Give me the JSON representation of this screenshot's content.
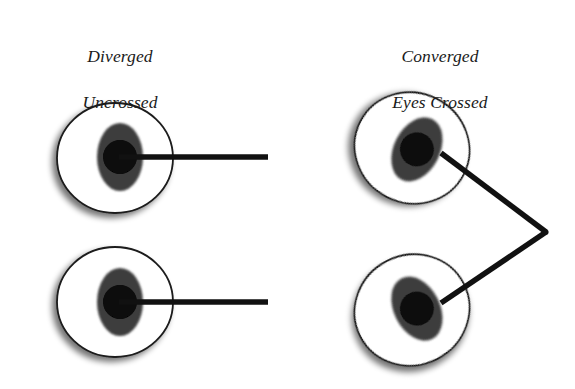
{
  "figure": {
    "background_color": "#ffffff"
  },
  "panels": [
    {
      "id": "left",
      "caption_line1": "Diverged",
      "caption_line2": "Uncrossed",
      "caption_x": 40,
      "caption_y": 22,
      "caption_width": 160
    },
    {
      "id": "right",
      "caption_line1": "Converged",
      "caption_line2": "Eyes Crossed",
      "caption_x": 360,
      "caption_y": 22,
      "caption_width": 160
    }
  ],
  "colors": {
    "sclera_fill": "#ffffff",
    "sclera_stroke": "#1b1b1b",
    "iris_fill": "#3e3e3e",
    "pupil_fill": "#070707",
    "sight_line": "#111111",
    "shadow": "#b9b9b9",
    "text": "#1a1a1a"
  },
  "geometry": {
    "sclera_rx": 58,
    "sclera_ry": 55,
    "sclera_stroke_width": 1.8,
    "iris_rx": 23,
    "iris_ry": 34,
    "pupil_r": 17,
    "sight_line_width": 5.5,
    "shadow_offset_x": -4,
    "shadow_offset_y": 4
  },
  "eyes": [
    {
      "name": "left-upper-eye",
      "panel": "left",
      "sclera_cx": 115,
      "sclera_cy": 158,
      "rotation_deg": 0,
      "iris_cx": 115,
      "iris_cy": 157,
      "iris_offset_x": 5,
      "pupil_cx": 119,
      "pupil_cy": 157
    },
    {
      "name": "left-lower-eye",
      "panel": "left",
      "sclera_cx": 115,
      "sclater_cy": 302,
      "sclera_cy": 302,
      "rotation_deg": 0,
      "iris_cx": 115,
      "iris_cy": 302,
      "iris_offset_x": 5,
      "pupil_cx": 119,
      "pupil_cy": 302
    },
    {
      "name": "right-upper-eye",
      "panel": "right",
      "sclera_cx": 412,
      "sclera_cy": 148,
      "rotation_deg": 27,
      "iris_cx": 412,
      "iris_cy": 148,
      "iris_offset_x": 5,
      "pupil_cx": 444,
      "pupil_cy": 155
    },
    {
      "name": "right-lower-eye",
      "panel": "right",
      "sclera_cx": 412,
      "sclera_cy": 310,
      "rotation_deg": -27,
      "iris_cx": 412,
      "iris_cy": 310,
      "iris_offset_x": 5,
      "pupil_cx": 444,
      "pupil_cy": 300
    }
  ],
  "sight_lines": [
    {
      "name": "left-upper-sight-line",
      "panel": "left",
      "x1": 119,
      "y1": 157,
      "x2": 268,
      "y2": 157,
      "direction": "parallel-horizontal"
    },
    {
      "name": "left-lower-sight-line",
      "panel": "left",
      "x1": 119,
      "y1": 302,
      "x2": 268,
      "y2": 302,
      "direction": "parallel-horizontal"
    },
    {
      "name": "right-upper-sight-line",
      "panel": "right",
      "x1": 444,
      "y1": 155,
      "x2": 546,
      "y2": 232,
      "direction": "converging-down-right"
    },
    {
      "name": "right-lower-sight-line",
      "panel": "right",
      "x1": 444,
      "y1": 300,
      "x2": 546,
      "y2": 232,
      "direction": "converging-up-right"
    }
  ],
  "convergence_point": {
    "name": "convergence-point",
    "x": 546,
    "y": 232,
    "visible": true
  }
}
